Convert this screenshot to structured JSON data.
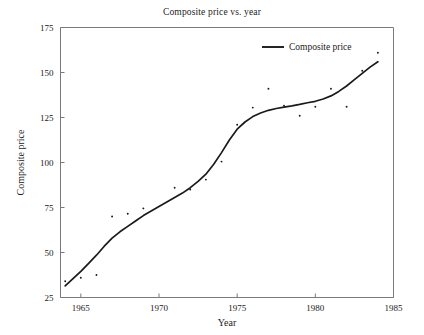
{
  "chart_data": {
    "type": "scatter",
    "title": "Composite price vs. year",
    "xlabel": "Year",
    "ylabel": "Composite price",
    "xlim": [
      1963.7,
      1985.0
    ],
    "ylim": [
      25,
      175
    ],
    "xticks": [
      1965,
      1970,
      1975,
      1980,
      1985
    ],
    "xtick_labels": [
      "1965",
      "1970",
      "1975",
      "1980",
      "1985"
    ],
    "yticks": [
      25,
      50,
      75,
      100,
      125,
      150,
      175
    ],
    "ytick_labels": [
      "25",
      "50",
      "75",
      "100",
      "125",
      "150",
      "175"
    ],
    "grid": false,
    "legend_position": "top-right",
    "legend": [
      {
        "label": "Composite price",
        "marker": "line",
        "color": "#1a1a1a"
      }
    ],
    "series": [
      {
        "name": "Composite price observations",
        "marker": "point",
        "color": "#1a1a1a",
        "x": [
          1964,
          1965,
          1966,
          1967,
          1968,
          1969,
          1971,
          1972,
          1973,
          1974,
          1975,
          1976,
          1977,
          1978,
          1979,
          1980,
          1981,
          1982,
          1983,
          1984
        ],
        "y": [
          34,
          36,
          37.5,
          70,
          71.5,
          74.5,
          86,
          85,
          90.5,
          100.5,
          121,
          130.5,
          141,
          131.5,
          126,
          131,
          141,
          131,
          151,
          161
        ]
      },
      {
        "name": "Composite price",
        "marker": "line",
        "color": "#1a1a1a",
        "x": [
          1964.0,
          1964.5,
          1965.0,
          1965.5,
          1966.0,
          1966.5,
          1967.0,
          1967.5,
          1968.0,
          1968.5,
          1969.0,
          1969.5,
          1970.0,
          1970.5,
          1971.0,
          1971.5,
          1972.0,
          1972.5,
          1973.0,
          1973.5,
          1974.0,
          1974.5,
          1975.0,
          1975.5,
          1976.0,
          1976.5,
          1977.0,
          1977.5,
          1978.0,
          1978.5,
          1979.0,
          1979.5,
          1980.0,
          1980.5,
          1981.0,
          1981.5,
          1982.0,
          1982.5,
          1983.0,
          1983.5,
          1984.0
        ],
        "y": [
          31.5,
          35.5,
          39.5,
          44.0,
          48.5,
          53.5,
          58.0,
          61.5,
          64.5,
          67.5,
          70.5,
          73.0,
          75.5,
          78.0,
          80.5,
          83.0,
          86.0,
          89.5,
          93.5,
          99.0,
          105.5,
          112.5,
          118.5,
          122.5,
          125.5,
          127.5,
          129.0,
          130.0,
          130.8,
          131.5,
          132.3,
          133.2,
          134.0,
          135.3,
          137.0,
          139.5,
          142.5,
          146.0,
          149.5,
          153.0,
          156.0
        ]
      }
    ]
  }
}
